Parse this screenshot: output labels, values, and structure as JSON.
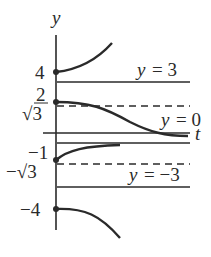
{
  "axes": {
    "y_label": "y",
    "t_label": "t"
  },
  "tick_labels": {
    "four": "4",
    "two_num": "2",
    "sqrt3": "√3",
    "neg_one": "−1",
    "neg_sqrt3": "−√3",
    "neg_four": "−4"
  },
  "line_labels": {
    "y3": {
      "var": "y",
      "eq": "= 3"
    },
    "y0": {
      "var": "y",
      "eq": "= 0"
    },
    "yneg3": {
      "var": "y",
      "eq": "= −3"
    }
  },
  "colors": {
    "ink": "#2a2a2a",
    "background": "#ffffff"
  }
}
